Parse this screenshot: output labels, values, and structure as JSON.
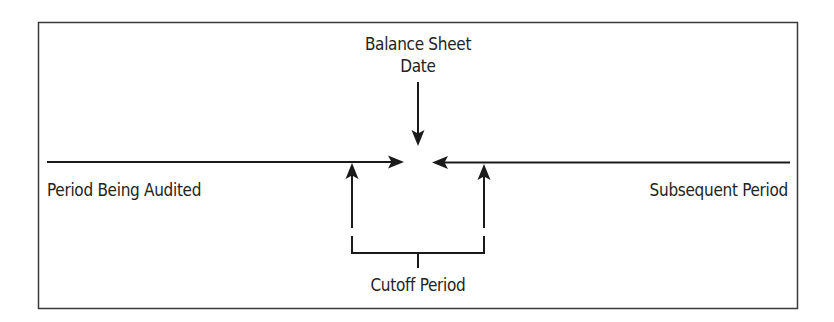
{
  "diagram": {
    "title_top_line1": "Balance Sheet",
    "title_top_line2": "Date",
    "left_label": "Period Being Audited",
    "right_label": "Subsequent Period",
    "bottom_label": "Cutoff Period",
    "colors": {
      "line": "#1a1a1a",
      "frame": "#3a3a3a",
      "text": "#232323",
      "background": "#ffffff"
    }
  }
}
